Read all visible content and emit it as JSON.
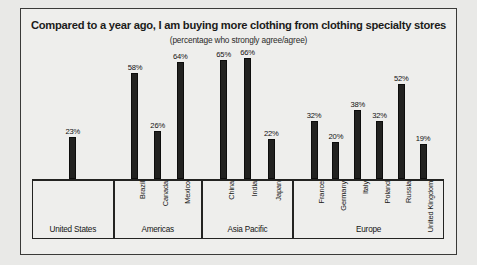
{
  "chart_data": {
    "type": "bar",
    "title": "Compared to a year ago, I am buying more clothing from clothing specialty stores",
    "subtitle": "(percentage who strongly agree/agree)",
    "xlabel": "",
    "ylabel": "",
    "ylim": [
      0,
      70
    ],
    "grid": false,
    "legend": "none",
    "value_suffix": "%",
    "categories": [
      "United States",
      "Brazil",
      "Canada",
      "Mexico",
      "China",
      "India",
      "Japan",
      "France",
      "Germany",
      "Italy",
      "Poland",
      "Russia",
      "United Kingdom"
    ],
    "values": [
      23,
      58,
      26,
      64,
      65,
      66,
      22,
      32,
      20,
      38,
      32,
      52,
      19
    ],
    "value_labels": [
      "23%",
      "58%",
      "26%",
      "64%",
      "65%",
      "66%",
      "22%",
      "32%",
      "20%",
      "38%",
      "32%",
      "52%",
      "19%"
    ],
    "groups": [
      {
        "label": "United States",
        "countries": [
          "United States"
        ]
      },
      {
        "label": "Americas",
        "countries": [
          "Brazil",
          "Canada",
          "Mexico"
        ]
      },
      {
        "label": "Asia Pacific",
        "countries": [
          "China",
          "India",
          "Japan"
        ]
      },
      {
        "label": "Europe",
        "countries": [
          "France",
          "Germany",
          "Italy",
          "Poland",
          "Russia",
          "United Kingdom"
        ]
      }
    ],
    "bar_color": "#222220",
    "background_color": "#eeeeec",
    "frame_color": "#3a3a38"
  }
}
